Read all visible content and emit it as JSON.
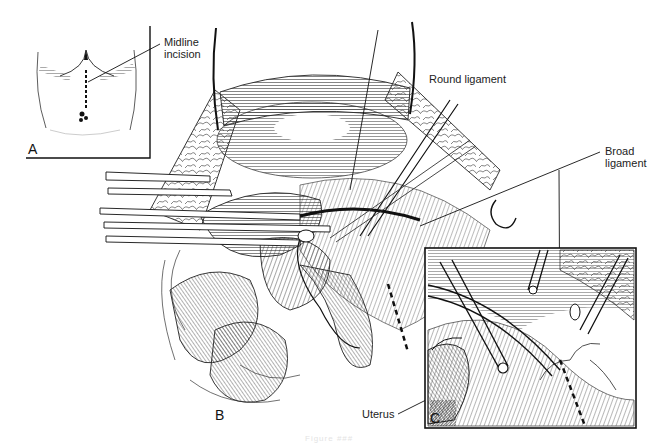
{
  "figure": {
    "caption": "Figure ###",
    "panels": [
      {
        "id": "A",
        "letter": "A",
        "description": "Abdomen with midline incision marked"
      },
      {
        "id": "B",
        "letter": "B",
        "description": "Opened pelvis with clamps on round ligament"
      },
      {
        "id": "C",
        "letter": "C",
        "description": "Inset detail of broad ligament incision along uterus"
      }
    ],
    "labels": {
      "midline_incision_line1": "Midline",
      "midline_incision_line2": "incision",
      "round_ligament": "Round ligament",
      "broad_ligament_line1": "Broad",
      "broad_ligament_line2": "ligament",
      "uterus": "Uterus"
    },
    "colors": {
      "ink": "#111111",
      "background": "#ffffff"
    }
  }
}
